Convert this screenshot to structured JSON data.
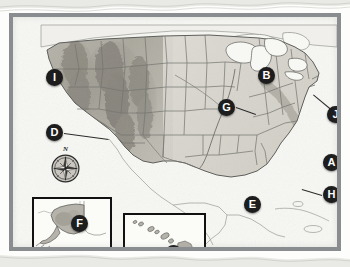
{
  "figure": {
    "frame_color": "#8a8d8f",
    "marker_color": "#1d1d1d",
    "marker_text_color": "#ffffff",
    "land_color": "#d8d6cf",
    "water_color": "#f4f4f1",
    "border_line_color": "#6f6f6f"
  },
  "compass": {
    "name": "compass-rose",
    "north_label": "N"
  },
  "markers": [
    {
      "label": "A",
      "x": 310,
      "y": 137,
      "name": "marker-a",
      "target": "Atlantic Ocean"
    },
    {
      "label": "B",
      "x": 245,
      "y": 50,
      "name": "marker-b",
      "target": "Lake Michigan"
    },
    {
      "label": "C",
      "x": 152,
      "y": 228,
      "name": "marker-c",
      "target": "Hawaii"
    },
    {
      "label": "D",
      "x": 33,
      "y": 107,
      "name": "marker-d",
      "target": "Pacific coast / California"
    },
    {
      "label": "E",
      "x": 231,
      "y": 179,
      "name": "marker-e",
      "target": "Gulf of Mexico"
    },
    {
      "label": "F",
      "x": 58,
      "y": 198,
      "name": "marker-f",
      "target": "Alaska"
    },
    {
      "label": "G",
      "x": 205,
      "y": 82,
      "name": "marker-g",
      "target": "Mississippi River"
    },
    {
      "label": "H",
      "x": 310,
      "y": 169,
      "name": "marker-h",
      "target": "Florida / Atlantic"
    },
    {
      "label": "I",
      "x": 33,
      "y": 52,
      "name": "marker-i",
      "target": "Pacific Ocean"
    },
    {
      "label": "J",
      "x": 314,
      "y": 89,
      "name": "marker-j",
      "target": "Northeast coast"
    }
  ],
  "leaders": [
    {
      "name": "leader-d",
      "x1": 51,
      "y1": 116,
      "x2": 96,
      "y2": 122
    },
    {
      "name": "leader-g",
      "x1": 223,
      "y1": 90,
      "x2": 243,
      "y2": 97
    },
    {
      "name": "leader-h",
      "x1": 309,
      "y1": 178,
      "x2": 289,
      "y2": 172
    },
    {
      "name": "leader-j",
      "x1": 318,
      "y1": 92,
      "x2": 300,
      "y2": 77
    }
  ],
  "insets": [
    {
      "name": "inset-alaska",
      "label": "Alaska",
      "x": 19,
      "y": 180,
      "w": 76,
      "h": 61
    },
    {
      "name": "inset-hawaii",
      "label": "Hawaii",
      "x": 110,
      "y": 196,
      "w": 79,
      "h": 48
    }
  ]
}
